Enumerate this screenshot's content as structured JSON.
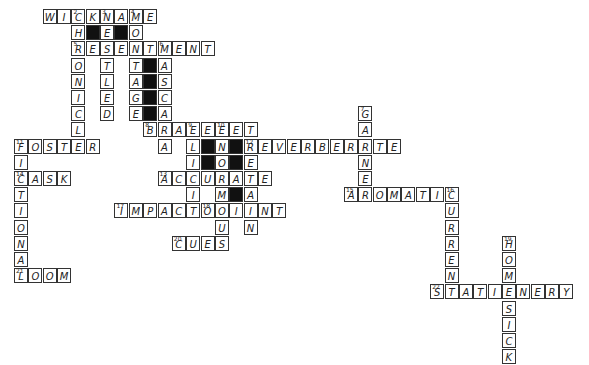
{
  "grid": {
    "origin_x": 14,
    "origin_y": 9,
    "cell_w": 14.35,
    "cell_h": 16.2
  },
  "across": [
    {
      "num": "",
      "row": 0,
      "col": 2,
      "answer": "WICKNAME",
      "nums": {
        "2": "2",
        "4": "3",
        "6": "4"
      }
    },
    {
      "num": "5",
      "row": 2,
      "col": 4,
      "answer": "RESENTMENT"
    },
    {
      "num": "8",
      "row": 7,
      "col": 9,
      "answer": "BRACELET",
      "nums": {
        "3": "9",
        "5": "10"
      }
    },
    {
      "num": "11",
      "row": 8,
      "col": 0,
      "answer": "FOSTER"
    },
    {
      "num": "12",
      "row": 8,
      "col": 16,
      "answer": "REVERBERATE"
    },
    {
      "num": "13",
      "row": 10,
      "col": 10,
      "answer": "ACCURATE"
    },
    {
      "num": "14",
      "row": 10,
      "col": 0,
      "answer": "TASK"
    },
    {
      "num": "15",
      "row": 11,
      "col": 23,
      "answer": "AROMATIC",
      "nums": {
        "7": "16"
      }
    },
    {
      "num": "17",
      "row": 12,
      "col": 7,
      "answer": "IMPACT"
    },
    {
      "num": "18",
      "row": 12,
      "col": 13,
      "answer": "ORIENT"
    },
    {
      "num": "20",
      "row": 14,
      "col": 11,
      "answer": "CUES"
    },
    {
      "num": "21",
      "row": 16,
      "col": 0,
      "answer": "LOOM"
    },
    {
      "num": "22",
      "row": 17,
      "col": 29,
      "answer": "STATIONERY"
    }
  ],
  "down": [
    {
      "num": "2",
      "row": 0,
      "col": 4,
      "answer": "CHRONICLE"
    },
    {
      "num": "3",
      "row": 0,
      "col": 6,
      "answer": "NESTLED"
    },
    {
      "num": "4",
      "row": 0,
      "col": 8,
      "answer": "MONTAGE"
    },
    {
      "num": "6",
      "row": 2,
      "col": 10,
      "answer": "MASCARA"
    },
    {
      "num": "7",
      "row": 6,
      "col": 24,
      "answer": "GARNER"
    },
    {
      "num": "9",
      "row": 7,
      "col": 12,
      "answer": "ELICIT"
    },
    {
      "num": "10",
      "row": 7,
      "col": 14,
      "answer": "ENORMOUS"
    },
    {
      "num": "11",
      "row": 8,
      "col": 0,
      "answer": "FICTIONAL"
    },
    {
      "num": "12",
      "row": 8,
      "col": 16,
      "answer": "RETAIN"
    },
    {
      "num": "16",
      "row": 11,
      "col": 30,
      "answer": "CURRENT"
    },
    {
      "num": "19",
      "row": 14,
      "col": 34,
      "answer": "HOMESICK"
    }
  ],
  "black_cells": [
    [
      1,
      5
    ],
    [
      1,
      7
    ],
    [
      3,
      9
    ],
    [
      4,
      9
    ],
    [
      5,
      9
    ],
    [
      6,
      9
    ],
    [
      8,
      13
    ],
    [
      9,
      13
    ],
    [
      8,
      15
    ],
    [
      9,
      15
    ],
    [
      11,
      15
    ]
  ]
}
